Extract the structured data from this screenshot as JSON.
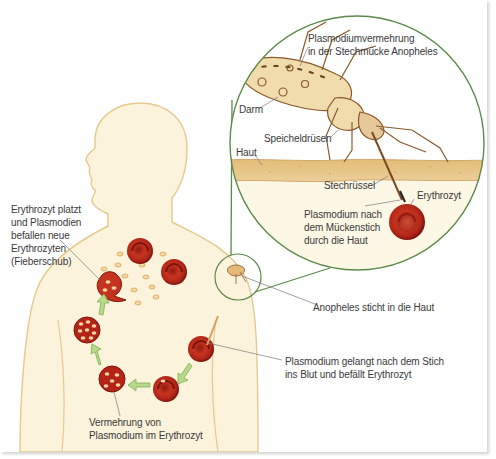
{
  "diagram": {
    "colors": {
      "skin": "#fbf3dc",
      "skin_outline": "#e6c98f",
      "skin_layer": "#e8c98a",
      "circle_line": "#5c8a4a",
      "blood_cell": "#b52418",
      "blood_cell_dark": "#7e130c",
      "arrow_green": "#a9cf7a",
      "mosquito": "#b07a45",
      "label_text": "#3a3a3a"
    },
    "labels": {
      "mosquito_multiplication": [
        "Plasmodiumvermehrung",
        "in der Stechmücke Anopheles"
      ],
      "gut": "Darm",
      "salivary_glands": "Speicheldrüsen",
      "skin": "Haut",
      "proboscis": "Stechrüssel",
      "erythrocyte": "Erythrozyt",
      "plasmodium_through_skin": [
        "Plasmodium nach",
        "dem Mückenstich",
        "durch die Haut"
      ],
      "anopheles_bites": "Anopheles sticht in die Haut",
      "plasmodium_enters_blood": [
        "Plasmodium gelangt nach dem Stich",
        "ins Blut und befällt Erythrozyt"
      ],
      "multiplication_in_erythrocyte": [
        "Vermehrung von",
        "Plasmodium im Erythrozyt"
      ],
      "erythrocyte_bursts": [
        "Erythrozyt platzt",
        "und Plasmodien",
        "befallen neue",
        "Erythrozyten",
        "(Fieberschub)"
      ]
    },
    "cycle_stages": [
      "Infected erythrocyte (right shoulder)",
      "Erythrocyte with early plasmodium",
      "Erythrocyte with plasmodia (bottom)",
      "Erythrocyte full of plasmodia (left)",
      "Burst erythrocyte releasing merozoites",
      "New healthy erythrocytes (neck)"
    ]
  }
}
